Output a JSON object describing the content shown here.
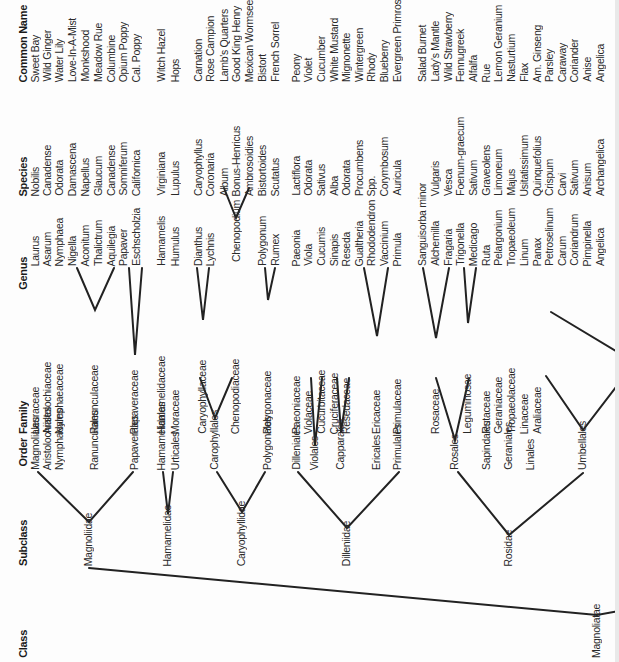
{
  "headers": {
    "common_name": "Common Name",
    "species": "Species",
    "genus": "Genus",
    "family": "Family",
    "order": "Order",
    "subclass": "Subclass",
    "class": "Class"
  },
  "rows": [
    {
      "x": 36,
      "common": "Sweet Bay",
      "species": "Nobilis",
      "genus": "Laurus"
    },
    {
      "x": 48,
      "common": "Wild Ginger",
      "species": "Canadense",
      "genus": "Asarum"
    },
    {
      "x": 60,
      "common": "Water Lily",
      "species": "Odorata",
      "genus": "Nymphaea"
    },
    {
      "x": 73,
      "common": "Love-In-A-Mist",
      "species": "Damascena",
      "genus": "Nigella"
    },
    {
      "x": 86,
      "common": "Monkshood",
      "species": "Napellus",
      "genus": "Aconitum"
    },
    {
      "x": 99,
      "common": "Meadow Rue",
      "species": "Glaucum",
      "genus": "Thalictrum"
    },
    {
      "x": 112,
      "common": "Columbine",
      "species": "Canadense",
      "genus": "Aquilegia"
    },
    {
      "x": 124,
      "common": "Opium Poppy",
      "species": "Somniferum",
      "genus": "Papaver"
    },
    {
      "x": 137,
      "common": "Cal. Poppy",
      "species": "Californica",
      "genus": "Eschscholzia"
    },
    {
      "x": 162,
      "common": "Witch Hazel",
      "species": "Virginiana",
      "genus": "Hamamelis"
    },
    {
      "x": 176,
      "common": "Hops",
      "species": "Lupulus",
      "genus": "Humulus"
    },
    {
      "x": 199,
      "common": "Carnation",
      "species": "Caryophyllus",
      "genus": "Dianthus"
    },
    {
      "x": 211,
      "common": "Rose Campion",
      "species": "Coronaria",
      "genus": "Lychnis"
    },
    {
      "x": 225,
      "common": "Lamb's Quarters",
      "species": "Album",
      "genus": ""
    },
    {
      "x": 237,
      "common": "Good King Henry",
      "species": "Bonus-Henricus",
      "genus": "Chenopodium"
    },
    {
      "x": 250,
      "common": "Mexican Wormseed Tea",
      "species": "Ambrosoidies",
      "genus": ""
    },
    {
      "x": 263,
      "common": "Bistort",
      "species": "Bistortoides",
      "genus": "Polygonum"
    },
    {
      "x": 276,
      "common": "French Sorrel",
      "species": "Scutatus",
      "genus": "Rumex"
    },
    {
      "x": 297,
      "common": "Peony",
      "species": "Lactiflora",
      "genus": "Paeonia"
    },
    {
      "x": 309,
      "common": "Violet",
      "species": "Odorata",
      "genus": "Viola"
    },
    {
      "x": 322,
      "common": "Cucumber",
      "species": "Sativus",
      "genus": "Cucumis"
    },
    {
      "x": 335,
      "common": "White Mustard",
      "species": "Alba",
      "genus": "Sinapis"
    },
    {
      "x": 347,
      "common": "Mignonette",
      "species": "Odorata",
      "genus": "Reseda"
    },
    {
      "x": 360,
      "common": "Wintergreen",
      "species": "Procumbens",
      "genus": "Gualtheria"
    },
    {
      "x": 372,
      "common": "Rhody",
      "species": "Spp.",
      "genus": "Rhododendron"
    },
    {
      "x": 385,
      "common": "Blueberry",
      "species": "Corymbosum",
      "genus": "Vaccinium"
    },
    {
      "x": 398,
      "common": "Evergreen Primrose",
      "species": "Auricula",
      "genus": "Primula"
    },
    {
      "x": 423,
      "common": "Salad Burnet",
      "species": "",
      "genus": "Sanguisorba minor"
    },
    {
      "x": 436,
      "common": "Lady's Mantle",
      "species": "Vulgaris",
      "genus": "Alchemilla"
    },
    {
      "x": 449,
      "common": "Wild Strawberry",
      "species": "Vesca",
      "genus": "Fragaria"
    },
    {
      "x": 461,
      "common": "Fennugreek",
      "species": "Foenum-graecum",
      "genus": "Trigonella"
    },
    {
      "x": 474,
      "common": "Alfalfa",
      "species": "Sativum",
      "genus": "Medicago"
    },
    {
      "x": 487,
      "common": "Rue",
      "species": "Graveolens",
      "genus": "Ruta"
    },
    {
      "x": 499,
      "common": "Lemon Geranium",
      "species": "Limoneum",
      "genus": "Pelargonium"
    },
    {
      "x": 512,
      "common": "Nasturtium",
      "species": "Majus",
      "genus": "Tropaeoleum"
    },
    {
      "x": 525,
      "common": "Flax",
      "species": "Usitatissimum",
      "genus": "Linum"
    },
    {
      "x": 538,
      "common": "Am. Ginseng",
      "species": "Quinquefolius",
      "genus": "Panax"
    },
    {
      "x": 550,
      "common": "Parsley",
      "species": "Crispum",
      "genus": "Petroselinum"
    },
    {
      "x": 563,
      "common": "Caraway",
      "species": "Carvi",
      "genus": "Carum"
    },
    {
      "x": 575,
      "common": "Coriander",
      "species": "Sativum",
      "genus": "Coriandrum"
    },
    {
      "x": 588,
      "common": "Anise",
      "species": "Anisum",
      "genus": "Pimpinella"
    },
    {
      "x": 601,
      "common": "Angelica",
      "species": "Archangelica",
      "genus": "Angelica"
    }
  ],
  "families": [
    {
      "x": 36,
      "bottom": 434,
      "label": "Lauraceae"
    },
    {
      "x": 48,
      "bottom": 434,
      "label": "Aristolochiaceae"
    },
    {
      "x": 60,
      "bottom": 434,
      "label": "Nymphaeaceae"
    },
    {
      "x": 95,
      "bottom": 434,
      "label": "Ranunculaceae"
    },
    {
      "x": 135,
      "bottom": 434,
      "label": "Papaveraceae"
    },
    {
      "x": 162,
      "bottom": 434,
      "label": "Hamamelidaceae"
    },
    {
      "x": 176,
      "bottom": 434,
      "label": "Moraceae"
    },
    {
      "x": 203,
      "bottom": 434,
      "label": "Caryophyllaceae"
    },
    {
      "x": 236,
      "bottom": 434,
      "label": "Chenopodiaceae"
    },
    {
      "x": 268,
      "bottom": 434,
      "label": "Polygonaceae"
    },
    {
      "x": 297,
      "bottom": 434,
      "label": "Paeoniaceae"
    },
    {
      "x": 309,
      "bottom": 434,
      "label": "Violaceae"
    },
    {
      "x": 322,
      "bottom": 434,
      "label": "Cucurbitaceae"
    },
    {
      "x": 335,
      "bottom": 434,
      "label": "Cruciferaceae"
    },
    {
      "x": 347,
      "bottom": 434,
      "label": "Resedaceae"
    },
    {
      "x": 377,
      "bottom": 434,
      "label": "Ericaceae"
    },
    {
      "x": 398,
      "bottom": 434,
      "label": "Primulaceae"
    },
    {
      "x": 436,
      "bottom": 434,
      "label": "Rosaceae"
    },
    {
      "x": 468,
      "bottom": 434,
      "label": "Leguminosae"
    },
    {
      "x": 487,
      "bottom": 434,
      "label": "Rutaceae"
    },
    {
      "x": 499,
      "bottom": 434,
      "label": "Geraniaceae"
    },
    {
      "x": 512,
      "bottom": 434,
      "label": "Tropaeolaceae"
    },
    {
      "x": 525,
      "bottom": 434,
      "label": "Linaceae"
    },
    {
      "x": 538,
      "bottom": 434,
      "label": "Araliaceae"
    }
  ],
  "orders": [
    {
      "x": 36,
      "bottom": 470,
      "label": "Magnoliales"
    },
    {
      "x": 48,
      "bottom": 470,
      "label": "Aristolochiales"
    },
    {
      "x": 60,
      "bottom": 470,
      "label": "Nymphaeales"
    },
    {
      "x": 95,
      "bottom": 470,
      "label": "Ranunculales"
    },
    {
      "x": 135,
      "bottom": 470,
      "label": "Papaverales"
    },
    {
      "x": 162,
      "bottom": 470,
      "label": "Hamamelidales"
    },
    {
      "x": 176,
      "bottom": 470,
      "label": "Urticales"
    },
    {
      "x": 215,
      "bottom": 470,
      "label": "Carophyllales"
    },
    {
      "x": 268,
      "bottom": 470,
      "label": "Polygonales"
    },
    {
      "x": 297,
      "bottom": 470,
      "label": "Dilleniales"
    },
    {
      "x": 315,
      "bottom": 470,
      "label": "Violales"
    },
    {
      "x": 341,
      "bottom": 470,
      "label": "Capparales"
    },
    {
      "x": 377,
      "bottom": 470,
      "label": "Ericales"
    },
    {
      "x": 398,
      "bottom": 470,
      "label": "Primulales"
    },
    {
      "x": 455,
      "bottom": 470,
      "label": "Rosales"
    },
    {
      "x": 487,
      "bottom": 470,
      "label": "Sapindales"
    },
    {
      "x": 509,
      "bottom": 470,
      "label": "Geraniales"
    },
    {
      "x": 531,
      "bottom": 470,
      "label": "Linales"
    },
    {
      "x": 583,
      "bottom": 470,
      "label": "Umbellales"
    }
  ],
  "subclasses": [
    {
      "x": 89,
      "bottom": 566,
      "label": "Magnoliidae"
    },
    {
      "x": 168,
      "bottom": 566,
      "label": "Hamamelidae"
    },
    {
      "x": 242,
      "bottom": 566,
      "label": "Caryophyllidae"
    },
    {
      "x": 347,
      "bottom": 566,
      "label": "Dilleniidae"
    },
    {
      "x": 509,
      "bottom": 566,
      "label": "Rosidae"
    }
  ],
  "classes": [
    {
      "x": 597,
      "bottom": 658,
      "label": "Magnoliatae"
    }
  ]
}
